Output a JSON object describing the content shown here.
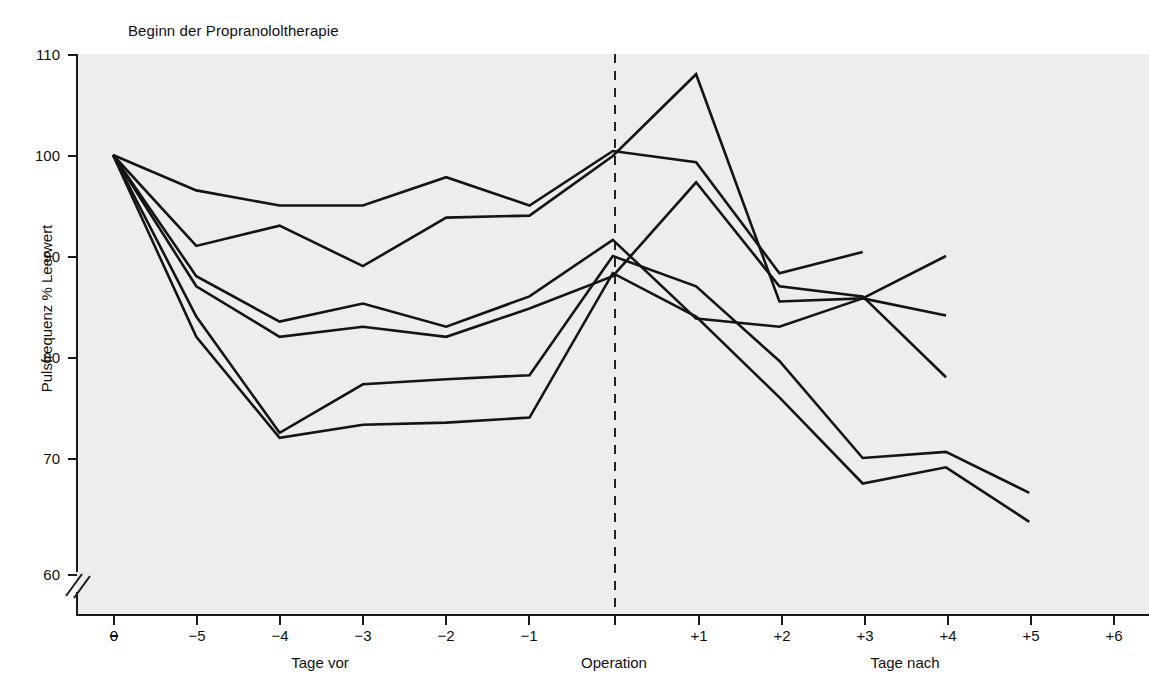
{
  "chart_data": {
    "type": "line",
    "title": "Beginn der Propranololtherapie",
    "xlabel": "",
    "ylabel": "Pulsfrequenz % Leerwert",
    "ylim": [
      60,
      110
    ],
    "yticks": [
      60,
      70,
      80,
      90,
      100,
      110
    ],
    "y_axis_break_below": 60,
    "grid": false,
    "legend": "none",
    "x": [
      "0",
      "−5",
      "−4",
      "−3",
      "−2",
      "−1",
      "Operation",
      "+1",
      "+2",
      "+3",
      "+4",
      "+5",
      "+6"
    ],
    "xticklabels": [
      "0",
      "−5",
      "−4",
      "−3",
      "−2",
      "−1",
      "",
      "+1",
      "+2",
      "+3",
      "+4",
      "+5",
      "+6"
    ],
    "x_tick_zero_struck": true,
    "x_group_labels": [
      {
        "text": "Tage vor",
        "at": "−4"
      },
      {
        "text": "Operation",
        "at": "Operation"
      },
      {
        "text": "Tage nach",
        "at": "+3"
      }
    ],
    "annotations": [
      {
        "text": "Beginn der Propranololtherapie",
        "kind": "title-annotation"
      },
      {
        "text": "Operation",
        "kind": "vertical-dashed-marker",
        "at": "Operation"
      }
    ],
    "series": [
      {
        "name": "Patient 1",
        "x": [
          "0",
          "−5",
          "−4",
          "−3",
          "−2",
          "−1",
          "Operation",
          "+1",
          "+2",
          "+3"
        ],
        "values": [
          100,
          96.5,
          95,
          95,
          97.8,
          95,
          100.4,
          99.3,
          88.3,
          90.4
        ]
      },
      {
        "name": "Patient 2",
        "x": [
          "0",
          "−5",
          "−4",
          "−3",
          "−2",
          "−1",
          "Operation",
          "+1",
          "+2",
          "+3",
          "+4"
        ],
        "values": [
          100,
          91,
          93,
          89,
          93.8,
          94,
          99.9,
          108,
          85.5,
          85.8,
          84.1
        ]
      },
      {
        "name": "Patient 3",
        "x": [
          "0",
          "−5",
          "−4",
          "−3",
          "−2",
          "−1",
          "Operation",
          "+1",
          "+2",
          "+3",
          "+4"
        ],
        "values": [
          100,
          88,
          83.5,
          85.3,
          83,
          86,
          91.6,
          83.8,
          83,
          85.8,
          90
        ]
      },
      {
        "name": "Patient 4",
        "x": [
          "0",
          "−5",
          "−4",
          "−3",
          "−2",
          "−1",
          "Operation",
          "+1",
          "+2",
          "+3",
          "+4"
        ],
        "values": [
          100,
          87,
          82,
          83,
          82,
          84.8,
          88,
          97.3,
          87,
          86,
          78
        ]
      },
      {
        "name": "Patient 5",
        "x": [
          "0",
          "−5",
          "−4",
          "−3",
          "−2",
          "−1",
          "Operation",
          "+1",
          "+2",
          "+3",
          "+4",
          "+5"
        ],
        "values": [
          100,
          84,
          72.5,
          77.3,
          77.8,
          78.2,
          90,
          87,
          79.6,
          70,
          70.6,
          67
        ]
      },
      {
        "name": "Patient 6",
        "x": [
          "0",
          "−5",
          "−4",
          "−3",
          "−2",
          "−1",
          "Operation",
          "+1",
          "+2",
          "+3",
          "+4",
          "+5"
        ],
        "values": [
          100,
          82,
          72,
          73.3,
          73.5,
          74,
          88.3,
          84,
          76,
          67.8,
          69.2,
          64.5
        ]
      }
    ]
  },
  "axis": {
    "y_title": "Pulsfrequenz % Leerwert",
    "tick_labels_y": [
      "110",
      "100",
      "90",
      "80",
      "70",
      "60"
    ],
    "tick_labels_x": [
      "0",
      "−5",
      "−4",
      "−3",
      "−2",
      "−1",
      "",
      "+1",
      "+2",
      "+3",
      "+4",
      "+5",
      "+6"
    ],
    "group_labels": [
      "Tage vor",
      "Operation",
      "Tage nach"
    ]
  },
  "title": {
    "text": "Beginn der Propranololtherapie"
  },
  "colors": {
    "line": "#141414",
    "plot_background": "#ededed",
    "axis": "#1a1a1a",
    "page_background": "#ffffff"
  }
}
